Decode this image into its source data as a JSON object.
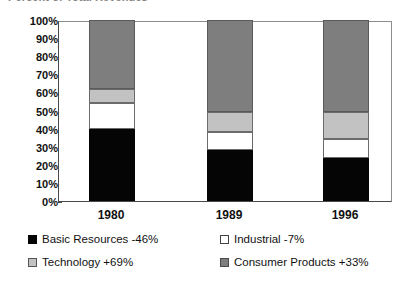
{
  "chart_data": {
    "type": "bar",
    "stacked": true,
    "normalized": true,
    "title": "Percent of Total Revenues",
    "xlabel": "",
    "ylabel": "",
    "ylim": [
      0,
      100
    ],
    "grid": false,
    "legend_position": "bottom",
    "categories": [
      "1980",
      "1989",
      "1996"
    ],
    "y_ticks": [
      "0%",
      "10%",
      "20%",
      "30%",
      "40%",
      "50%",
      "60%",
      "70%",
      "80%",
      "90%",
      "100%"
    ],
    "y_tick_values": [
      0,
      10,
      20,
      30,
      40,
      50,
      60,
      70,
      80,
      90,
      100
    ],
    "series": [
      {
        "name": "Basic Resources -46%",
        "short_name": "Basic Resources",
        "change": "-46%",
        "color": "#050505",
        "values": [
          40,
          28,
          24
        ]
      },
      {
        "name": "Industrial -7%",
        "short_name": "Industrial",
        "change": "-7%",
        "color": "#ffffff",
        "values": [
          14,
          10,
          10
        ]
      },
      {
        "name": "Technology +69%",
        "short_name": "Technology",
        "change": "+69%",
        "color": "#c2c2c2",
        "values": [
          8,
          11,
          15
        ]
      },
      {
        "name": "Consumer Products +33%",
        "short_name": "Consumer Products",
        "change": "+33%",
        "color": "#7e7e7e",
        "values": [
          38,
          51,
          51
        ]
      }
    ]
  },
  "legend": {
    "items": [
      {
        "label": "Basic Resources -46%"
      },
      {
        "label": "Industrial -7%"
      },
      {
        "label": "Technology +69%"
      },
      {
        "label": "Consumer Products +33%"
      }
    ]
  }
}
